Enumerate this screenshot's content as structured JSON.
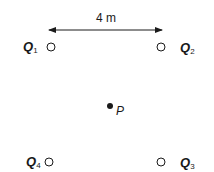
{
  "diagram": {
    "distance_label": "4 m",
    "charges": [
      {
        "name": "Q",
        "subscript": "1",
        "position": "top-left"
      },
      {
        "name": "Q",
        "subscript": "2",
        "position": "top-right"
      },
      {
        "name": "Q",
        "subscript": "3",
        "position": "bottom-right"
      },
      {
        "name": "Q",
        "subscript": "4",
        "position": "bottom-left"
      }
    ],
    "point": {
      "name": "P",
      "position": "center"
    }
  }
}
